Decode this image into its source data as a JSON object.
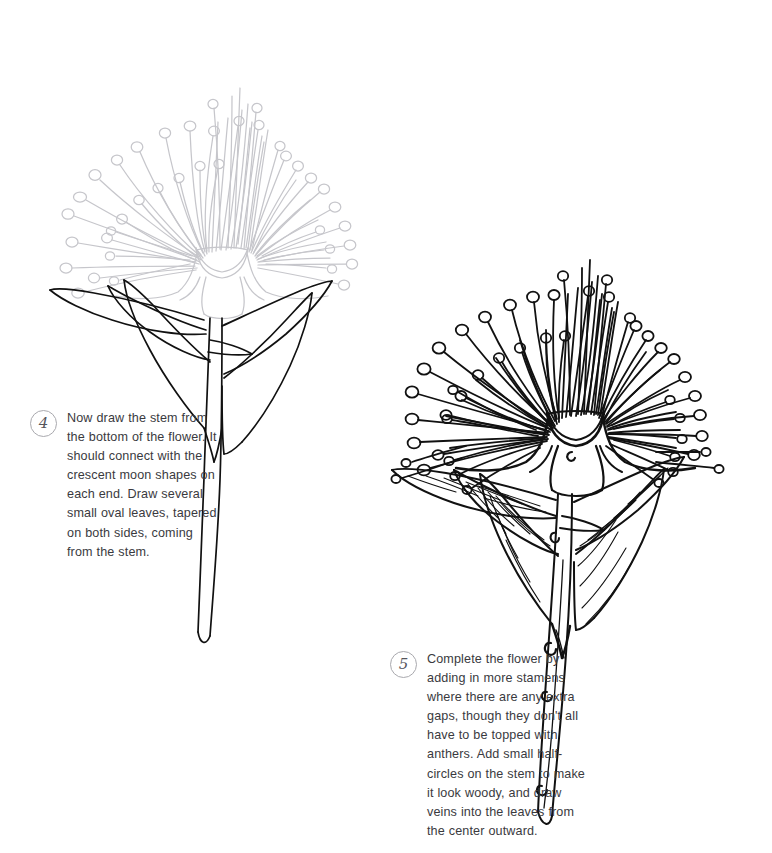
{
  "page": {
    "background_color": "#ffffff",
    "width": 772,
    "height": 853,
    "kind": "illustrated drawing tutorial page"
  },
  "colors": {
    "ink_black": "#111111",
    "guide_gray": "#c6c6cb",
    "text_gray": "#3a3a3e",
    "badge_stroke": "#a9a9ae",
    "badge_numeral": "#55555c"
  },
  "steps": [
    {
      "number": "4",
      "badge_name": "step-4-badge",
      "text": "Now draw the stem from the bottom of the flower. It should connect with the crescent moon shapes on each end. Draw several small oval leaves, tapered on both sides, coming from the stem."
    },
    {
      "number": "5",
      "badge_name": "step-5-badge",
      "text": "Complete the flower by adding in more stamens where there are any extra gaps, though they don't all have to be topped with anthers. Add small half-circles on the stem to make it look woody, and draw veins into the leaves from the center outward."
    }
  ],
  "illustrations": [
    {
      "id": "step-4-illustration",
      "subject": "pohutukawa-style flower",
      "flower_head_color": "#c6c6cb",
      "flower_head_state": "faded guide lines",
      "stem_and_leaves_color": "#111111",
      "stem_and_leaves_state": "newly drawn in dark ink",
      "leaf_count": 4,
      "has_leaf_veins": false,
      "has_woody_half_circles": false
    },
    {
      "id": "step-5-illustration",
      "subject": "pohutukawa-style flower",
      "flower_head_color": "#111111",
      "flower_head_state": "fully inked with extra stamens",
      "stem_and_leaves_color": "#111111",
      "stem_and_leaves_state": "fully inked",
      "leaf_count": 4,
      "has_leaf_veins": true,
      "has_woody_half_circles": true,
      "half_circle_count": 5
    }
  ]
}
